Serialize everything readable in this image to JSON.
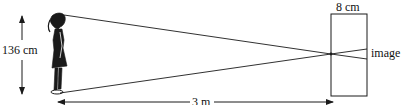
{
  "diagram": {
    "type": "pinhole-camera",
    "labels": {
      "height": "136 cm",
      "box_depth": "8 cm",
      "image": "image",
      "distance": "3 m"
    },
    "colors": {
      "line": "#1a1a1a",
      "background": "#ffffff"
    }
  }
}
